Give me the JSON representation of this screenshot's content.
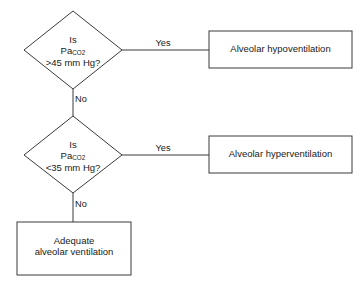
{
  "diagram": {
    "background_color": "#ffffff",
    "line_color": "#3a3a3a",
    "nodes": {
      "decision_1": {
        "shape": "diamond",
        "line_1": "Is",
        "line_2_prefix": "Pa",
        "line_2_subscript": "CO2",
        "line_3": ">45 mm Hg?"
      },
      "decision_2": {
        "shape": "diamond",
        "line_1": "Is",
        "line_2_prefix": "Pa",
        "line_2_subscript": "CO2",
        "line_3": "<35 mm Hg?"
      },
      "outcome_hypoventilation": {
        "shape": "rectangle",
        "line_1": "Alveolar hypoventilation"
      },
      "outcome_hyperventilation": {
        "shape": "rectangle",
        "line_1": "Alveolar hyperventilation"
      },
      "outcome_adequate": {
        "shape": "rectangle",
        "line_1": "Adequate",
        "line_2": "alveolar ventilation"
      }
    },
    "edges": {
      "decision_1_yes": "Yes",
      "decision_1_no": "No",
      "decision_2_yes": "Yes",
      "decision_2_no": "No"
    }
  }
}
